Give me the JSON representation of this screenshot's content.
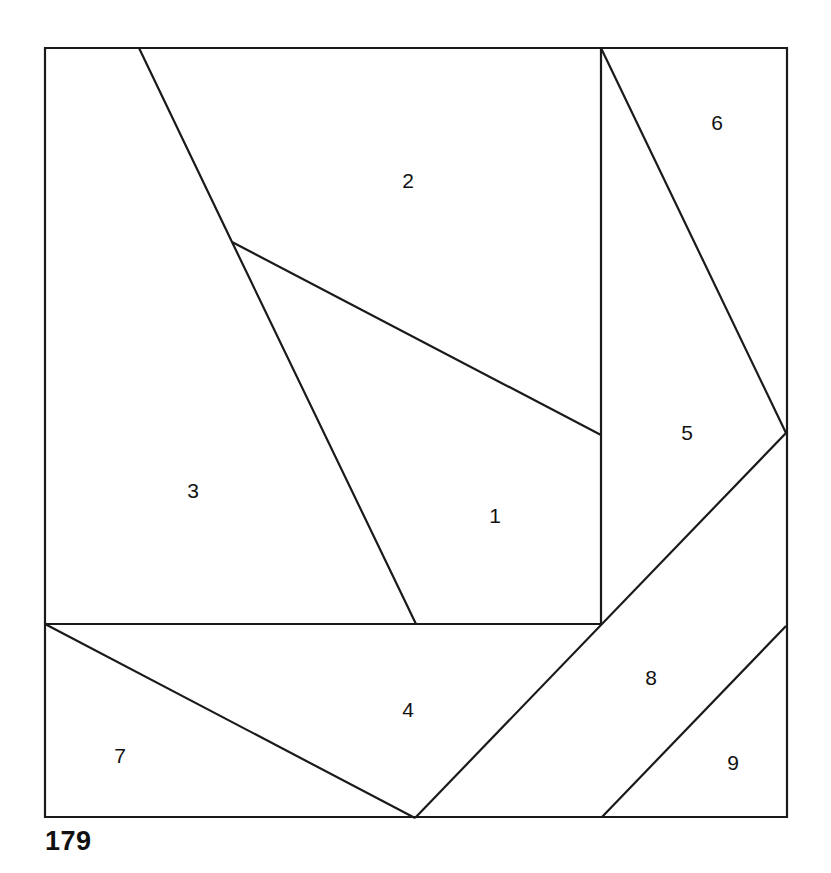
{
  "figure": {
    "caption": "179",
    "stroke_color": "#1a1a1a",
    "fill_color": "#ffffff",
    "label_color": "#121212",
    "border": {
      "x": 45,
      "y": 48,
      "width": 742,
      "height": 769
    },
    "regions": [
      {
        "id": "region-1",
        "label": "1",
        "cx": 495,
        "cy": 517
      },
      {
        "id": "region-2",
        "label": "2",
        "cx": 408,
        "cy": 182
      },
      {
        "id": "region-3",
        "label": "3",
        "cx": 193,
        "cy": 492
      },
      {
        "id": "region-4",
        "label": "4",
        "cx": 408,
        "cy": 711
      },
      {
        "id": "region-5",
        "label": "5",
        "cx": 687,
        "cy": 434
      },
      {
        "id": "region-6",
        "label": "6",
        "cx": 717,
        "cy": 124
      },
      {
        "id": "region-7",
        "label": "7",
        "cx": 120,
        "cy": 757
      },
      {
        "id": "region-8",
        "label": "8",
        "cx": 651,
        "cy": 679
      },
      {
        "id": "region-9",
        "label": "9",
        "cx": 733,
        "cy": 764
      }
    ],
    "outline": "M45,48 L787,48 L787,817 L45,817 Z",
    "cuts": [
      {
        "name": "cut-top-left-diagonal",
        "d": "M139,48 L232,242 L416,624"
      },
      {
        "name": "cut-branch-to-vertical",
        "d": "M232,242 L601,435"
      },
      {
        "name": "cut-vertical-divider",
        "d": "M601,48 L601,624"
      },
      {
        "name": "cut-horizontal-divider",
        "d": "M45,624 L601,624"
      },
      {
        "name": "cut-upper-right-diagonal",
        "d": "M601,48 L786,433"
      },
      {
        "name": "cut-lower-right-diagonal",
        "d": "M786,433 L415,818"
      },
      {
        "name": "cut-lower-left-diagonal",
        "d": "M45,624 L415,818"
      },
      {
        "name": "cut-corner-diagonal",
        "d": "M602,817 L786,626"
      }
    ]
  }
}
